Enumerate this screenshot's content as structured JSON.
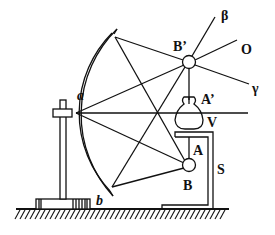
{
  "diagram": {
    "labels": {
      "a": "a",
      "b": "b",
      "B_prime": "B’",
      "B": "B",
      "A_prime": "A’",
      "A": "A",
      "V": "V",
      "S": "S",
      "beta": "β",
      "O": "O",
      "gamma": "γ"
    }
  }
}
